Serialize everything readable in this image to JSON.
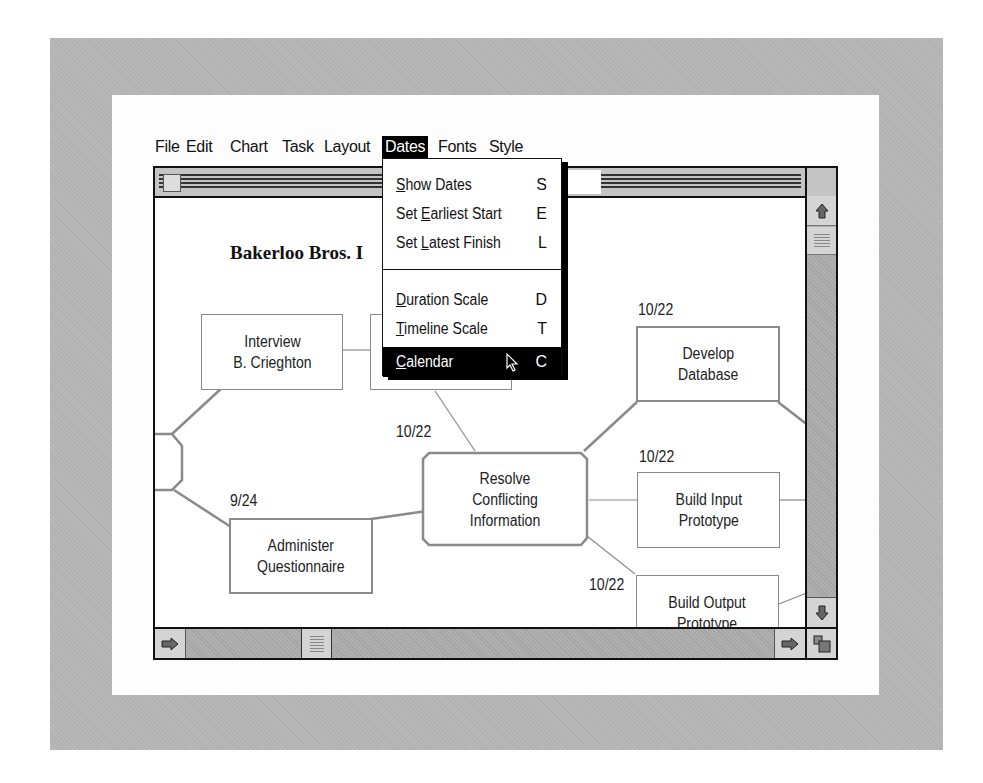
{
  "menubar": {
    "items": [
      {
        "label": "File"
      },
      {
        "label": "Edit"
      },
      {
        "label": "Chart"
      },
      {
        "label": "Task"
      },
      {
        "label": "Layout"
      },
      {
        "label": "Dates",
        "active": true
      },
      {
        "label": "Fonts"
      },
      {
        "label": "Style"
      }
    ]
  },
  "dates_menu": {
    "items": [
      {
        "pre": "",
        "ul": "S",
        "post": "how Dates",
        "key": "S"
      },
      {
        "pre": "Set ",
        "ul": "E",
        "post": "arliest Start",
        "key": "E"
      },
      {
        "pre": "Set ",
        "ul": "L",
        "post": "atest Finish",
        "key": "L"
      },
      {
        "pre": "",
        "ul": "D",
        "post": "uration Scale",
        "key": "D"
      },
      {
        "pre": "",
        "ul": "T",
        "post": "imeline Scale",
        "key": "T"
      },
      {
        "pre": "",
        "ul": "C",
        "post": "alendar",
        "key": "C",
        "highlighted": true
      }
    ]
  },
  "chart": {
    "title": "Bakerloo Bros. I",
    "nodes": [
      {
        "id": "interview",
        "line1": "Interview",
        "line2": "B. Crieghton"
      },
      {
        "id": "hidden",
        "line1": "",
        "line2": ""
      },
      {
        "id": "administer",
        "line1": "Administer",
        "line2": "Questionnaire",
        "date": "9/24"
      },
      {
        "id": "resolve",
        "line1": "Resolve",
        "line2": "Conflicting",
        "line3": "Information",
        "date": "10/22"
      },
      {
        "id": "develop",
        "line1": "Develop",
        "line2": "Database",
        "date": "10/22"
      },
      {
        "id": "build_input",
        "line1": "Build Input",
        "line2": "Prototype",
        "date": "10/22"
      },
      {
        "id": "build_output",
        "line1": "Build Output",
        "line2": "Prototype",
        "date": "10/22"
      }
    ]
  },
  "colors": {
    "frame": "#b8b8b8",
    "node_border": "#8a8a8a",
    "menu_highlight": "#000000"
  }
}
